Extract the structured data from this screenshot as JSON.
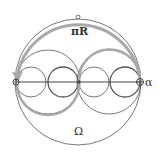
{
  "diagram": {
    "labels": {
      "top": "πR",
      "bottom": "Ω",
      "right_point": "α"
    },
    "colors": {
      "outline": "#555555",
      "arc": "#a8a8a8",
      "small_circle": "#666666",
      "axis": "#444444"
    }
  }
}
